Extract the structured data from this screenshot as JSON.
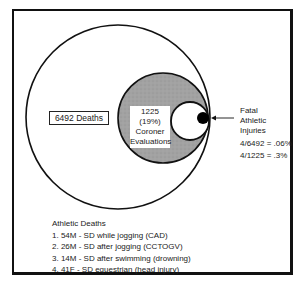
{
  "diagram": {
    "outer_circle_label": "6492 Deaths",
    "middle_circle_label": [
      "1225 (19%)",
      "Coroner",
      "Evaluations"
    ],
    "inner_label": [
      "Fatal",
      "Athletic",
      "Injuries"
    ],
    "ratios": [
      "4/6492 = .06%",
      "4/1225 = .3%"
    ],
    "colors": {
      "gray_fill": "#9a9a9a",
      "stroke": "#111111",
      "dot": "#000000"
    }
  },
  "athletic_deaths": {
    "title": "Athletic Deaths",
    "items": [
      "1. 54M  -  SD while jogging (CAD)",
      "2. 26M  -  SD after jogging (CCTOGV)",
      "3. 14M  -  SD after swimming (drowning)",
      "4. 41F  -  SD equestrian (head injury)"
    ]
  }
}
